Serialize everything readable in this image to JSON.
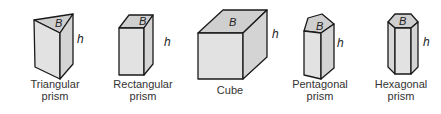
{
  "shapes": [
    {
      "id": "triangular",
      "base_label": "B",
      "height_label": "h",
      "name_line1": "Triangular",
      "name_line2": "prism"
    },
    {
      "id": "rectangular",
      "base_label": "B",
      "height_label": "h",
      "name_line1": "Rectangular",
      "name_line2": "prism"
    },
    {
      "id": "cube",
      "base_label": "B",
      "height_label": "h",
      "name_line1": "Cube",
      "name_line2": ""
    },
    {
      "id": "pentagonal",
      "base_label": "B",
      "height_label": "h",
      "name_line1": "Pentagonal",
      "name_line2": "prism"
    },
    {
      "id": "hexagonal",
      "base_label": "B",
      "height_label": "h",
      "name_line1": "Hexagonal",
      "name_line2": "prism"
    }
  ],
  "colors": {
    "face_front": "#e2e2e2",
    "face_side": "#d4d4d4",
    "face_top": "#cfcfcf",
    "stroke": "#1a1a1a",
    "text": "#333333"
  }
}
